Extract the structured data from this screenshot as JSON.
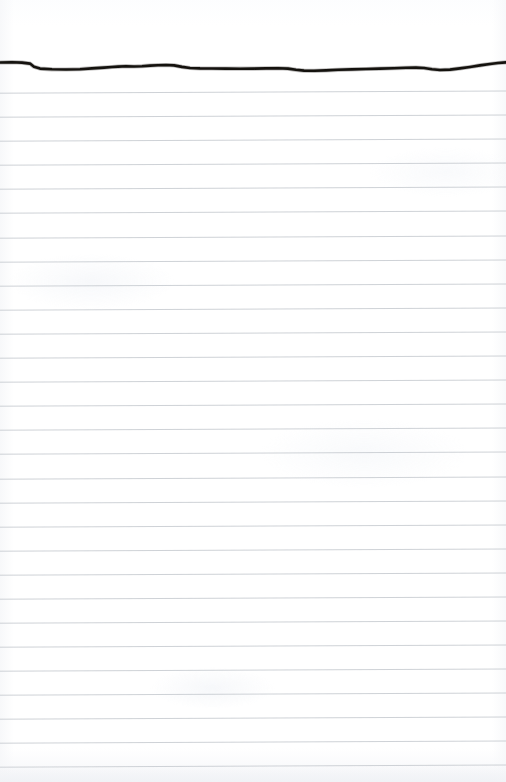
{
  "page": {
    "kind": "ruled-notepad-page",
    "width": 506,
    "height": 782,
    "background_color": "#ffffff",
    "paper_tint_color": "#f7f8fa"
  },
  "ink_stroke": {
    "name": "handwritten-horizontal-stroke",
    "color": "#14120f",
    "stroke_width": 2.6,
    "description": "single wavy hand-drawn horizontal ink line across the top of the page",
    "path": "M 0,62.5 L 12,62.2 L 22,62.6 L 30,63.6 L 34,66.8 L 40,68.6 L 52,69.3 L 66,69.5 L 80,69.2 L 92,68.4 L 104,67.6 L 112,67.0 L 118,66.6 L 126,66.2 L 134,66.5 L 142,66.2 L 150,65.6 L 158,65.2 L 166,65.0 L 174,65.4 L 182,66.9 L 190,68.0 L 200,68.4 L 212,68.5 L 226,68.6 L 240,68.7 L 254,68.6 L 266,68.4 L 278,68.2 L 288,68.6 L 296,69.8 L 304,70.6 L 314,70.8 L 326,70.4 L 338,69.8 L 352,69.4 L 366,69.0 L 380,68.6 L 394,68.2 L 406,67.8 L 416,67.6 L 424,68.0 L 432,69.2 L 440,70.0 L 450,69.6 L 460,68.4 L 470,67.0 L 480,65.4 L 490,64.0 L 498,63.0 L 506,62.4"
  },
  "ruled_lines": {
    "name": "horizontal-rule-lines",
    "color": "#c3c7cd",
    "stroke_width": 0.9,
    "count": 28,
    "first_y": 91,
    "spacing": 24.1,
    "left_y_offset": 2.2,
    "note": "faint grey ruled lines spanning full page width, tilting very slightly upward toward the right edge",
    "y_positions": [
      91,
      115,
      139,
      163,
      187,
      211,
      236,
      260,
      284,
      308,
      332,
      356,
      380,
      404,
      428,
      452,
      477,
      501,
      525,
      549,
      573,
      597,
      621,
      645,
      669,
      693,
      717,
      741,
      765
    ]
  }
}
